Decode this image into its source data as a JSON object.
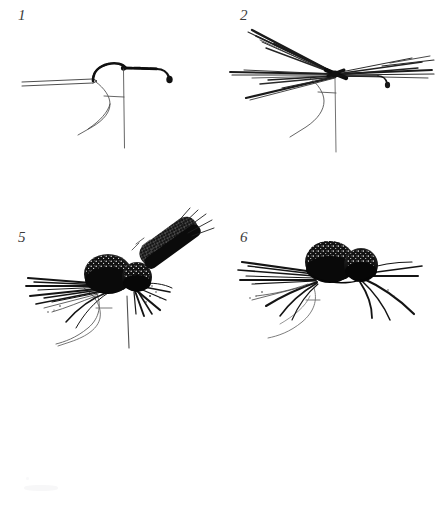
{
  "plate": {
    "kind": "scanned-illustration-plate",
    "background_color": "#ffffff",
    "ink_color": "#1a1a1a",
    "label_color": "#3b3b3b",
    "width": 443,
    "height": 519,
    "subject": "fly-tying step sequence: deer-hair spider / bass bug on a hook held in a vise",
    "caption": ""
  },
  "figures": [
    {
      "id": "figure-1",
      "label": "1",
      "label_x": 18,
      "label_y": 8,
      "title": "bare hook in vise with thread base",
      "description": "Hook clamped in vise jaws, thread wrapped along the shank, bobbin thread hanging straight down.",
      "elements": [
        "vise-jaws",
        "hook-bend",
        "hook-shank",
        "hook-eye",
        "thread-wraps",
        "bobbin-thread",
        "hook-point"
      ]
    },
    {
      "id": "figure-2",
      "label": "2",
      "label_x": 240,
      "label_y": 8,
      "title": "hackle fibers tied in along shank",
      "description": "Long splayed hackle / bucktail fibers tied fore and aft along the hook shank, forming crossed legs.",
      "elements": [
        "vise-jaws",
        "hook-bend",
        "hook-shank",
        "hook-eye",
        "fiber-bundle-rear-upper",
        "fiber-bundle-rear-lower",
        "fiber-bundle-forward",
        "bobbin-thread"
      ]
    },
    {
      "id": "figure-5",
      "label": "5",
      "label_x": 18,
      "label_y": 230,
      "title": "spun deer hair body with wing being tied in",
      "description": "Two dense spun-and-clipped deer-hair body segments on the shank, splayed legs below, a hair wing slanting up and back at the rear.",
      "elements": [
        "deer-hair-abdomen",
        "deer-hair-thorax",
        "hair-wing",
        "legs-left",
        "legs-right",
        "vise-jaws",
        "bobbin-thread"
      ]
    },
    {
      "id": "figure-6",
      "label": "6",
      "label_x": 240,
      "label_y": 230,
      "title": "finished deer-hair spider",
      "description": "Completed fly: clipped deer-hair head and body with legs radiating out on both sides, hook point visible below.",
      "elements": [
        "deer-hair-abdomen",
        "deer-hair-thorax",
        "legs-left",
        "legs-right",
        "hook-bend",
        "hook-point"
      ]
    }
  ]
}
